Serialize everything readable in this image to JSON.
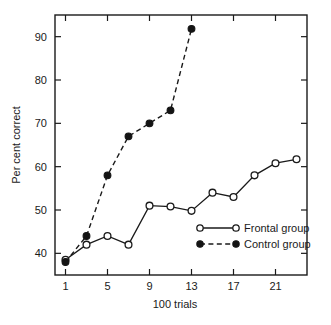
{
  "chart_data": {
    "type": "line",
    "title": "",
    "xlabel": "100 trials",
    "ylabel": "Per cent correct",
    "xlim": [
      0,
      24
    ],
    "ylim": [
      35,
      95
    ],
    "xticks": [
      1,
      5,
      9,
      13,
      17,
      21
    ],
    "xticklabels": [
      "1",
      "5",
      "9",
      "13",
      "17",
      "21"
    ],
    "yticks": [
      40,
      50,
      60,
      70,
      80,
      90
    ],
    "yticklabels": [
      "40",
      "50",
      "60",
      "70",
      "80",
      "90"
    ],
    "grid": false,
    "legend_position": "center-right-inside",
    "series": [
      {
        "name": "Frontal group",
        "marker": "open-circle",
        "linestyle": "solid",
        "color": "#1a1a1a",
        "x": [
          1,
          3,
          5,
          7,
          9,
          11,
          13,
          15,
          17,
          19,
          21,
          23
        ],
        "values": [
          38.5,
          42.0,
          44.0,
          42.0,
          51.0,
          50.8,
          49.8,
          54.0,
          53.0,
          58.0,
          60.8,
          61.7
        ]
      },
      {
        "name": "Control group",
        "marker": "filled-circle",
        "linestyle": "dashed",
        "color": "#141414",
        "x": [
          1,
          3,
          5,
          7,
          9,
          11,
          13
        ],
        "values": [
          38.0,
          44.0,
          58.0,
          67.0,
          70.0,
          73.0,
          91.8
        ]
      }
    ]
  },
  "legend": {
    "entries": [
      {
        "label": "Frontal group"
      },
      {
        "label": "Control group"
      }
    ]
  },
  "axes": {
    "x_title": "100 trials",
    "y_title": "Per cent correct"
  }
}
